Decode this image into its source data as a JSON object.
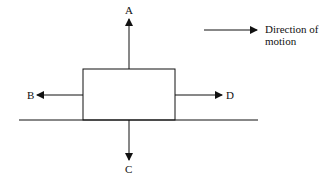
{
  "diagram": {
    "forces": {
      "A": "A",
      "B": "B",
      "C": "C",
      "D": "D"
    },
    "legend": {
      "line1": "Direction of",
      "line2": "motion"
    },
    "colors": {
      "stroke": "#111111",
      "background": "#ffffff"
    }
  }
}
